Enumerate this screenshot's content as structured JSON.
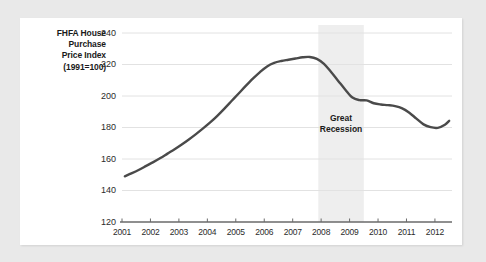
{
  "chart_data": {
    "type": "line",
    "title": "",
    "ylabel": "FHFA House Purchase Price Index (1991=100)",
    "ylabel_lines": [
      "FHFA House",
      "Purchase",
      "Price Index",
      "(1991=100)"
    ],
    "xlabel": "",
    "xlim": [
      2001,
      2012.6
    ],
    "ylim": [
      120,
      240
    ],
    "yticks": [
      120,
      140,
      160,
      180,
      200,
      220,
      240
    ],
    "xticks": [
      2001,
      2002,
      2003,
      2004,
      2005,
      2006,
      2007,
      2008,
      2009,
      2010,
      2011,
      2012
    ],
    "grid": true,
    "legend": "none",
    "line_color": "#4a4a4a",
    "grid_color": "#e2e2e2",
    "axis_color": "#6a6a6a",
    "band_color": "#eeeeee",
    "page_background": "#e9e9e9",
    "card_background": "#ffffff",
    "annotations": [
      {
        "text": "Great Recession",
        "lines": [
          "Great",
          "Recession"
        ],
        "type": "shaded-band-label",
        "x_start": 2007.9,
        "x_end": 2009.5
      }
    ],
    "series": [
      {
        "name": "FHFA House Purchase Price Index",
        "x": [
          2001.1,
          2001.35,
          2001.6,
          2001.85,
          2002.1,
          2002.35,
          2002.6,
          2002.85,
          2003.1,
          2003.35,
          2003.6,
          2003.85,
          2004.1,
          2004.35,
          2004.6,
          2004.85,
          2005.1,
          2005.35,
          2005.6,
          2005.85,
          2006.1,
          2006.35,
          2006.6,
          2006.85,
          2007.1,
          2007.35,
          2007.6,
          2007.85,
          2008.1,
          2008.35,
          2008.6,
          2008.85,
          2009.1,
          2009.35,
          2009.6,
          2009.85,
          2010.1,
          2010.35,
          2010.6,
          2010.85,
          2011.1,
          2011.35,
          2011.6,
          2011.85,
          2012.1,
          2012.35,
          2012.5
        ],
        "values": [
          149.0,
          151.0,
          153.2,
          155.6,
          158.0,
          160.6,
          163.4,
          166.2,
          169.2,
          172.4,
          175.8,
          179.4,
          183.2,
          187.4,
          192.0,
          196.8,
          201.6,
          206.4,
          211.0,
          215.2,
          218.8,
          221.0,
          222.2,
          223.0,
          223.8,
          224.6,
          224.8,
          223.6,
          220.4,
          215.2,
          209.6,
          204.0,
          199.0,
          197.4,
          197.2,
          195.4,
          194.6,
          194.2,
          193.6,
          192.2,
          189.4,
          185.6,
          182.0,
          180.2,
          179.8,
          181.8,
          184.2
        ]
      }
    ]
  }
}
